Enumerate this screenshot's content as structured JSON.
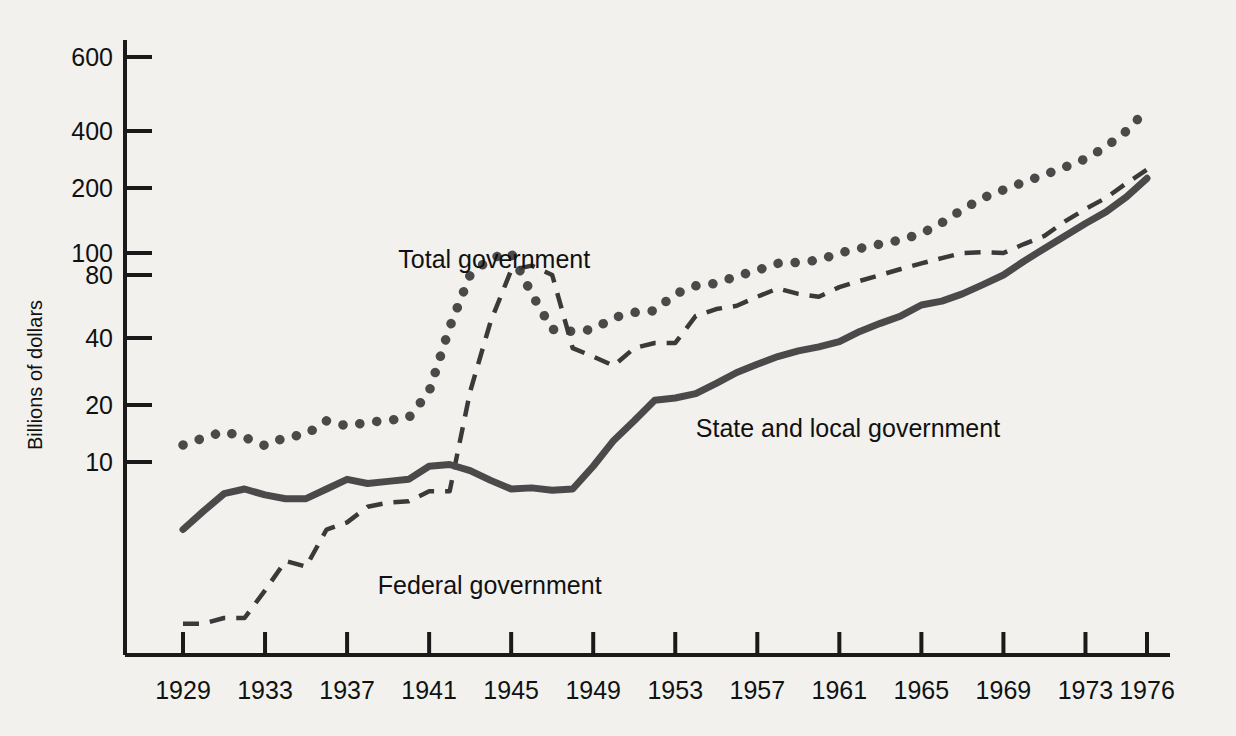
{
  "chart_data": {
    "type": "line",
    "title": "",
    "subtitle": "",
    "xlabel": "",
    "ylabel": "Billions of dollars",
    "yscale": "log",
    "ylim": [
      1.2,
      700
    ],
    "xlim": [
      1929,
      1976
    ],
    "grid": false,
    "legend_position": "inline-annotations",
    "y_ticks": [
      10,
      20,
      40,
      80,
      100,
      200,
      400,
      600
    ],
    "y_tick_labels": [
      "10",
      "20",
      "40",
      "80",
      "100",
      "200",
      "400",
      "600"
    ],
    "x_ticks": [
      1929,
      1933,
      1937,
      1941,
      1945,
      1949,
      1953,
      1957,
      1961,
      1965,
      1969,
      1973,
      1976
    ],
    "x_tick_labels": [
      "1929",
      "1933",
      "1937",
      "1941",
      "1945",
      "1949",
      "1953",
      "1957",
      "1961",
      "1965",
      "1969",
      "1973",
      "1976"
    ],
    "x": [
      1929,
      1930,
      1931,
      1932,
      1933,
      1934,
      1935,
      1936,
      1937,
      1938,
      1939,
      1940,
      1941,
      1942,
      1943,
      1944,
      1945,
      1946,
      1947,
      1948,
      1949,
      1950,
      1951,
      1952,
      1953,
      1954,
      1955,
      1956,
      1957,
      1958,
      1959,
      1960,
      1961,
      1962,
      1963,
      1964,
      1965,
      1966,
      1967,
      1968,
      1969,
      1970,
      1971,
      1972,
      1973,
      1974,
      1975,
      1976
    ],
    "series": [
      {
        "name": "Total government",
        "style": "dotted",
        "color": "#4a4a4a",
        "values": [
          12.3,
          13.4,
          14.5,
          13.5,
          12.2,
          13.5,
          14.0,
          16.5,
          15.5,
          16.2,
          16.6,
          17.1,
          23.0,
          45.0,
          80.0,
          95.0,
          100.0,
          65.0,
          44.0,
          43.0,
          44.0,
          50.0,
          53.0,
          54.0,
          65.0,
          71.0,
          73.0,
          79.0,
          84.0,
          90.0,
          91.0,
          93.0,
          100.0,
          105.0,
          110.0,
          115.0,
          123.0,
          138.0,
          159.0,
          180.0,
          196.0,
          215.0,
          235.0,
          258.0,
          285.0,
          330.0,
          400.0,
          450.0
        ]
      },
      {
        "name": "Federal government",
        "style": "dashed",
        "color": "#3a3a3a",
        "values": [
          1.4,
          1.4,
          1.5,
          1.5,
          2.1,
          3.0,
          2.8,
          4.4,
          4.8,
          5.8,
          6.1,
          6.2,
          7.0,
          7.0,
          23.0,
          48.0,
          84.0,
          88.0,
          80.0,
          36.0,
          33.0,
          30.0,
          36.0,
          38.0,
          38.0,
          51.0,
          55.0,
          57.0,
          63.0,
          69.0,
          65.0,
          63.0,
          70.0,
          75.0,
          80.0,
          85.0,
          90.0,
          95.0,
          100.0,
          101.0,
          100.0,
          110.0,
          120.0,
          140.0,
          160.0,
          180.0,
          212.0,
          250.0
        ]
      },
      {
        "name": "State and local government",
        "style": "solid",
        "color": "#4a4a4a",
        "values": [
          4.4,
          5.5,
          6.8,
          7.2,
          6.7,
          6.4,
          6.4,
          7.2,
          8.1,
          7.7,
          7.9,
          8.1,
          9.5,
          9.7,
          9.0,
          8.0,
          7.2,
          7.3,
          7.1,
          7.2,
          9.5,
          13.0,
          16.5,
          21.0,
          21.5,
          22.5,
          25.0,
          28.0,
          30.5,
          33.0,
          35.0,
          36.5,
          38.5,
          43.0,
          47.0,
          51.0,
          57.5,
          60.0,
          65.0,
          72.0,
          80.0,
          92.0,
          105.0,
          120.0,
          137.0,
          155.0,
          182.0,
          225.0
        ]
      }
    ],
    "annotations": [
      {
        "text": "Total government",
        "x": 1939.5,
        "y_px": 268,
        "name": "total-government-label"
      },
      {
        "text": "Federal government",
        "x": 1938.5,
        "y_px": 594,
        "name": "federal-government-label"
      },
      {
        "text": "State and local government",
        "x": 1954.0,
        "y_px": 437,
        "name": "state-local-government-label"
      }
    ]
  },
  "axis": {
    "y_title": "Billions of dollars"
  },
  "colors": {
    "background": "#f2f1ee",
    "axis": "#1a1a1a",
    "total": "#4a4a4a",
    "federal": "#3a3a3a",
    "state_local": "#4a4a4a"
  }
}
